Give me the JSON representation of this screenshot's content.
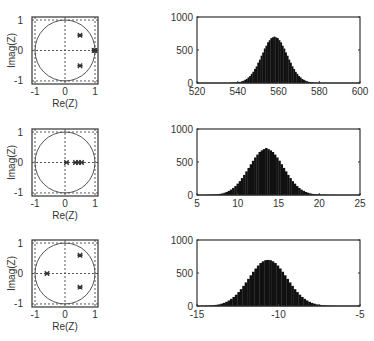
{
  "figure": {
    "rows": [
      {
        "pz": {
          "xlabel": "Re(Z)",
          "ylabel": "Imag(Z)",
          "xticks": [
            "-1",
            "0",
            "1"
          ],
          "yticks": [
            "1",
            "0",
            "-1"
          ],
          "markers": [
            [
              0.5,
              0.5
            ],
            [
              0.5,
              -0.5
            ],
            [
              0.97,
              0
            ],
            [
              1.0,
              0
            ]
          ]
        },
        "hist": {
          "xticks": [
            "520",
            "540",
            "560",
            "580",
            "600"
          ],
          "yticks": [
            "1000",
            "500",
            "0"
          ]
        }
      },
      {
        "pz": {
          "xlabel": "Re(Z)",
          "ylabel": "Imag(Z)",
          "xticks": [
            "-1",
            "0",
            "1"
          ],
          "yticks": [
            "1",
            "0",
            "-1"
          ],
          "markers": [
            [
              0.05,
              0
            ],
            [
              0.35,
              0
            ],
            [
              0.45,
              0
            ],
            [
              0.55,
              0
            ]
          ]
        },
        "hist": {
          "xticks": [
            "5",
            "10",
            "15",
            "20",
            "25"
          ],
          "yticks": [
            "1000",
            "500",
            "0"
          ]
        }
      },
      {
        "pz": {
          "xlabel": "Re(Z)",
          "ylabel": "Imag(Z)",
          "xticks": [
            "-1",
            "0",
            "1"
          ],
          "yticks": [
            "1",
            "0",
            "-1"
          ],
          "markers": [
            [
              -0.6,
              0
            ],
            [
              0.5,
              0.6
            ],
            [
              0.5,
              -0.45
            ]
          ]
        },
        "hist": {
          "xticks": [
            "-15",
            "",
            "-10",
            "",
            "-5"
          ],
          "yticks": [
            "1000",
            "500",
            "0"
          ]
        }
      }
    ]
  },
  "chart_data": [
    {
      "type": "scatter",
      "title": "Pole-zero plot 1",
      "xlabel": "Re(Z)",
      "ylabel": "Imag(Z)",
      "xlim": [
        -1.1,
        1.1
      ],
      "ylim": [
        -1.1,
        1.1
      ],
      "unit_circle": true,
      "points": [
        [
          0.5,
          0.5
        ],
        [
          0.5,
          -0.5
        ],
        [
          0.97,
          0
        ],
        [
          1.0,
          0
        ]
      ]
    },
    {
      "type": "bar",
      "title": "Histogram 1",
      "xlabel": "",
      "ylabel": "",
      "xlim": [
        520,
        600
      ],
      "ylim": [
        0,
        1000
      ],
      "x_start": 536.4,
      "bin_width": 0.8,
      "values": [
        2,
        3,
        5,
        6,
        8,
        13,
        17,
        26,
        34,
        49,
        61,
        85,
        106,
        139,
        170,
        214,
        252,
        309,
        354,
        414,
        462,
        523,
        565,
        617,
        648,
        680,
        692,
        703,
        690,
        680,
        648,
        616,
        565,
        522,
        463,
        413,
        355,
        307,
        253,
        213,
        169,
        139,
        106,
        85,
        61,
        48,
        35,
        26,
        17,
        13,
        8,
        6,
        4,
        3,
        2,
        1,
        1,
        1,
        0,
        0
      ]
    },
    {
      "type": "scatter",
      "title": "Pole-zero plot 2",
      "xlabel": "Re(Z)",
      "ylabel": "Imag(Z)",
      "xlim": [
        -1.1,
        1.1
      ],
      "ylim": [
        -1.1,
        1.1
      ],
      "unit_circle": true,
      "points": [
        [
          0.05,
          0
        ],
        [
          0.35,
          0
        ],
        [
          0.45,
          0
        ],
        [
          0.55,
          0
        ]
      ]
    },
    {
      "type": "bar",
      "title": "Histogram 2",
      "xlabel": "",
      "ylabel": "",
      "xlim": [
        5,
        25
      ],
      "ylim": [
        0,
        1000
      ],
      "x_start": 6.2,
      "bin_width": 0.27,
      "values": [
        3,
        4,
        5,
        7,
        9,
        12,
        17,
        24,
        34,
        46,
        62,
        82,
        107,
        136,
        172,
        210,
        256,
        304,
        358,
        410,
        466,
        518,
        569,
        612,
        652,
        676,
        696,
        712,
        695,
        676,
        652,
        612,
        568,
        520,
        466,
        410,
        358,
        304,
        256,
        210,
        172,
        136,
        107,
        82,
        62,
        46,
        34,
        24,
        17,
        12,
        9,
        7,
        5,
        4,
        3,
        2,
        1,
        1,
        1,
        0
      ]
    },
    {
      "type": "scatter",
      "title": "Pole-zero plot 3",
      "xlabel": "Re(Z)",
      "ylabel": "Imag(Z)",
      "xlim": [
        -1.1,
        1.1
      ],
      "ylim": [
        -1.1,
        1.1
      ],
      "unit_circle": true,
      "points": [
        [
          -0.6,
          0
        ],
        [
          0.5,
          0.6
        ],
        [
          0.5,
          -0.45
        ]
      ]
    },
    {
      "type": "bar",
      "title": "Histogram 3",
      "xlabel": "",
      "ylabel": "",
      "xlim": [
        -15,
        -5
      ],
      "ylim": [
        0,
        1000
      ],
      "x_start": -14.7,
      "bin_width": 0.15,
      "values": [
        2,
        3,
        4,
        6,
        9,
        12,
        18,
        25,
        35,
        47,
        63,
        83,
        108,
        137,
        171,
        211,
        255,
        305,
        357,
        411,
        465,
        519,
        568,
        613,
        651,
        677,
        694,
        698,
        694,
        677,
        651,
        613,
        568,
        519,
        465,
        411,
        357,
        305,
        255,
        211,
        171,
        137,
        108,
        83,
        63,
        47,
        35,
        25,
        18,
        12,
        9,
        6,
        4,
        3,
        2,
        1,
        1,
        1,
        0,
        0
      ]
    }
  ]
}
